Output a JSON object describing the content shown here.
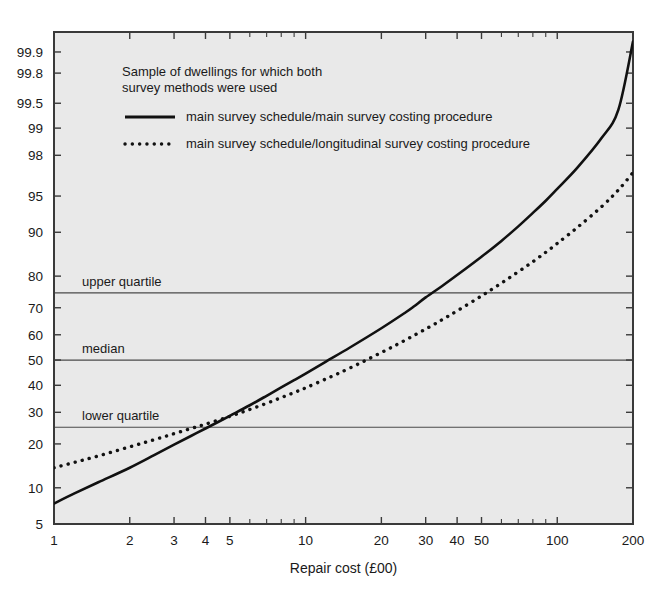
{
  "chart_data": {
    "type": "line",
    "title": "",
    "xlabel": "Repair cost (£00)",
    "ylabel": "",
    "xscale": "log",
    "yscale": "normal-probability",
    "xlim": [
      1,
      200
    ],
    "ylim": [
      5,
      99.95
    ],
    "grid": false,
    "xticks": [
      1,
      2,
      3,
      4,
      5,
      10,
      20,
      30,
      40,
      50,
      100,
      200
    ],
    "xtick_labels": [
      "1",
      "2",
      "3",
      "4",
      "5",
      "10",
      "20",
      "30",
      "40",
      "50",
      "100",
      "200"
    ],
    "xminor_ticks": [
      6,
      7,
      8,
      9,
      60,
      70,
      80,
      90
    ],
    "yticks": [
      5,
      10,
      20,
      30,
      40,
      50,
      60,
      70,
      80,
      90,
      95,
      98,
      99,
      99.5,
      99.8,
      99.9
    ],
    "ytick_labels": [
      "5",
      "10",
      "20",
      "30",
      "40",
      "50",
      "60",
      "70",
      "80",
      "90",
      "95",
      "98",
      "99",
      "99.5",
      "99.8",
      "99.9"
    ],
    "reference_lines": [
      {
        "name": "upper quartile",
        "label": "upper quartile",
        "value": 75
      },
      {
        "name": "median",
        "label": "median",
        "value": 50
      },
      {
        "name": "lower quartile",
        "label": "lower quartile",
        "value": 25
      }
    ],
    "series": [
      {
        "name": "main survey schedule/main survey costing procedure",
        "style": "solid",
        "color": "#111111",
        "points": [
          [
            1,
            7.5
          ],
          [
            1.2,
            9.0
          ],
          [
            1.5,
            11.0
          ],
          [
            2,
            14.0
          ],
          [
            2.5,
            17.0
          ],
          [
            3,
            19.8
          ],
          [
            3.5,
            22.3
          ],
          [
            4,
            24.6
          ],
          [
            5,
            28.8
          ],
          [
            6,
            32.5
          ],
          [
            7,
            36.0
          ],
          [
            8,
            39.2
          ],
          [
            9,
            42.0
          ],
          [
            10,
            44.6
          ],
          [
            12,
            49.3
          ],
          [
            15,
            55.0
          ],
          [
            20,
            62.5
          ],
          [
            25,
            68.4
          ],
          [
            27,
            70.5
          ],
          [
            30,
            73.5
          ],
          [
            35,
            77.2
          ],
          [
            40,
            80.3
          ],
          [
            50,
            85.0
          ],
          [
            60,
            88.4
          ],
          [
            70,
            91.0
          ],
          [
            80,
            93.0
          ],
          [
            90,
            94.5
          ],
          [
            100,
            95.7
          ],
          [
            120,
            97.3
          ],
          [
            150,
            98.7
          ],
          [
            175,
            99.4
          ],
          [
            200,
            99.93
          ]
        ]
      },
      {
        "name": "main survey schedule/longitudinal survey costing procedure",
        "style": "dotted",
        "color": "#111111",
        "points": [
          [
            1,
            14.0
          ],
          [
            1.2,
            15.2
          ],
          [
            1.5,
            16.8
          ],
          [
            2,
            19.2
          ],
          [
            2.5,
            21.2
          ],
          [
            3,
            23.0
          ],
          [
            3.5,
            24.6
          ],
          [
            4,
            26.0
          ],
          [
            5,
            28.6
          ],
          [
            6,
            31.0
          ],
          [
            7,
            33.2
          ],
          [
            8,
            35.3
          ],
          [
            9,
            37.2
          ],
          [
            10,
            39.0
          ],
          [
            12,
            42.4
          ],
          [
            15,
            46.8
          ],
          [
            20,
            53.0
          ],
          [
            25,
            58.0
          ],
          [
            30,
            62.2
          ],
          [
            33,
            64.4
          ],
          [
            35,
            65.8
          ],
          [
            40,
            68.9
          ],
          [
            50,
            74.0
          ],
          [
            60,
            78.0
          ],
          [
            70,
            81.2
          ],
          [
            80,
            83.8
          ],
          [
            90,
            86.0
          ],
          [
            100,
            87.9
          ],
          [
            120,
            90.8
          ],
          [
            150,
            93.8
          ],
          [
            175,
            95.6
          ],
          [
            200,
            97.0
          ]
        ]
      }
    ],
    "annotations": [
      {
        "name": "legend-heading-line1",
        "text": "Sample of dwellings for which both"
      },
      {
        "name": "legend-heading-line2",
        "text": "survey methods were used"
      }
    ]
  },
  "legend": {
    "heading_line1": "Sample of dwellings for which both",
    "heading_line2": "survey methods were used",
    "entries": [
      {
        "label": "main survey schedule/main survey costing procedure",
        "style": "solid"
      },
      {
        "label": "main survey schedule/longitudinal survey costing procedure",
        "style": "dotted"
      }
    ]
  },
  "axis": {
    "x_caption": "Repair cost (£00)"
  },
  "colors": {
    "plot_background": "#e9e9e9",
    "page_background": "#ffffff",
    "axis": "#3a3a3a",
    "curve": "#111111",
    "reference_line": "#4a4a4a",
    "text": "#1a1a1a"
  }
}
